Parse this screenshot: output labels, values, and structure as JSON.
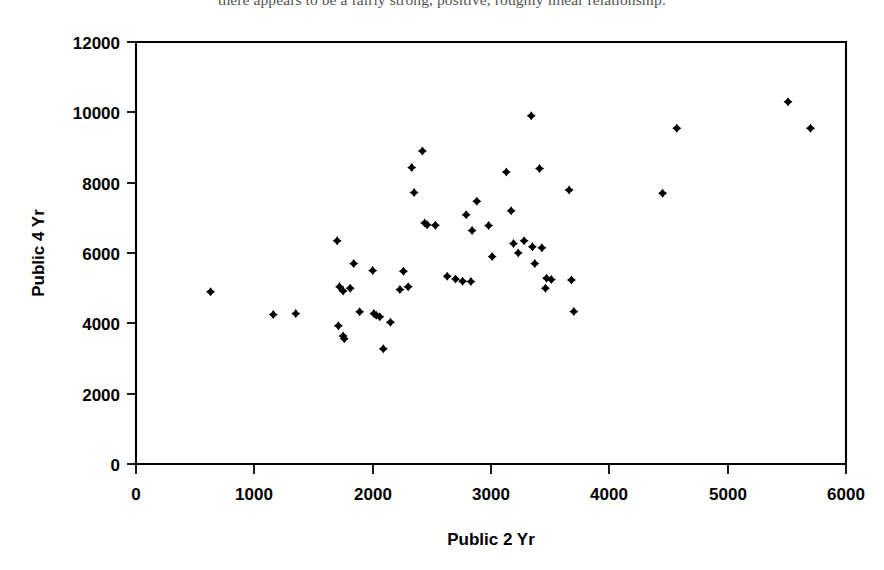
{
  "caption": {
    "clipped_text": "there appears to be a fairly strong, positive, roughly linear relationship."
  },
  "chart_data": {
    "type": "scatter",
    "title": "",
    "xlabel": "Public 2 Yr",
    "ylabel": "Public 4 Yr",
    "xlim": [
      0,
      6000
    ],
    "ylim": [
      0,
      12000
    ],
    "xticks": [
      0,
      1000,
      2000,
      3000,
      4000,
      5000,
      6000
    ],
    "yticks": [
      0,
      2000,
      4000,
      6000,
      8000,
      10000,
      12000
    ],
    "xtick_labels": [
      "0",
      "1000",
      "2000",
      "3000",
      "4000",
      "5000",
      "6000"
    ],
    "ytick_labels": [
      "0",
      "2000",
      "4000",
      "6000",
      "8000",
      "10000",
      "12000"
    ],
    "grid": false,
    "legend": false,
    "marker": "diamond",
    "marker_color": "#000000",
    "marker_size": 9,
    "n_points": 62,
    "points": [
      [
        630,
        4900
      ],
      [
        1160,
        4250
      ],
      [
        1350,
        4280
      ],
      [
        1700,
        6350
      ],
      [
        1720,
        5040
      ],
      [
        1750,
        4920
      ],
      [
        1710,
        3930
      ],
      [
        1750,
        3640
      ],
      [
        1760,
        3560
      ],
      [
        1840,
        5700
      ],
      [
        1810,
        5000
      ],
      [
        1890,
        4330
      ],
      [
        2000,
        5500
      ],
      [
        2010,
        4280
      ],
      [
        2030,
        4230
      ],
      [
        2060,
        4190
      ],
      [
        2090,
        3280
      ],
      [
        2150,
        4030
      ],
      [
        2260,
        5480
      ],
      [
        2230,
        4960
      ],
      [
        2300,
        5040
      ],
      [
        2330,
        8430
      ],
      [
        2350,
        7720
      ],
      [
        2420,
        8900
      ],
      [
        2440,
        6850
      ],
      [
        2460,
        6800
      ],
      [
        2530,
        6790
      ],
      [
        2630,
        5340
      ],
      [
        2700,
        5260
      ],
      [
        2760,
        5200
      ],
      [
        2790,
        7090
      ],
      [
        2840,
        6640
      ],
      [
        2830,
        5190
      ],
      [
        2880,
        7470
      ],
      [
        2980,
        6780
      ],
      [
        3010,
        5900
      ],
      [
        3130,
        8300
      ],
      [
        3170,
        7200
      ],
      [
        3190,
        6270
      ],
      [
        3230,
        6000
      ],
      [
        3280,
        6350
      ],
      [
        3340,
        9900
      ],
      [
        3350,
        6180
      ],
      [
        3370,
        5700
      ],
      [
        3410,
        8400
      ],
      [
        3430,
        6150
      ],
      [
        3470,
        5280
      ],
      [
        3460,
        5000
      ],
      [
        3510,
        5250
      ],
      [
        3660,
        7790
      ],
      [
        3680,
        5230
      ],
      [
        3700,
        4340
      ],
      [
        4450,
        7700
      ],
      [
        4570,
        9550
      ],
      [
        5510,
        10300
      ],
      [
        5700,
        9550
      ]
    ]
  }
}
